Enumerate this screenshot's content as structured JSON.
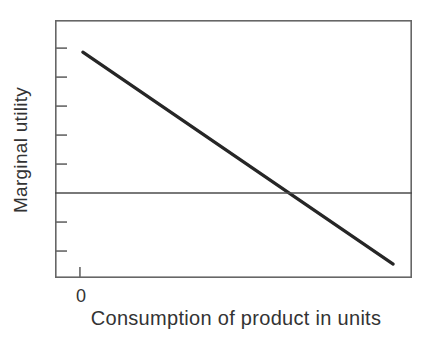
{
  "figure": {
    "background": "#ffffff"
  },
  "colors": {
    "frame": "#666666",
    "tick": "#666666",
    "curve": "#262626",
    "reference_line": "#4d4d4d",
    "text": "#333333"
  },
  "chart_data": {
    "type": "line",
    "title": "",
    "xlabel": "Consumption of product in units",
    "ylabel": "Marginal utility",
    "xlim": [
      -0.86,
      11.45
    ],
    "ylim": [
      -2.93,
      5.97
    ],
    "grid": false,
    "legend": false,
    "y_ticks": [
      5,
      4,
      3,
      2,
      1,
      -1,
      -2
    ],
    "x_ticks": [
      {
        "value": 0,
        "label": "0"
      }
    ],
    "series": [
      {
        "name": "marginal_utility_curve",
        "role": "curve",
        "points": [
          [
            0.1,
            4.86
          ],
          [
            10.8,
            -2.45
          ]
        ]
      },
      {
        "name": "zero_reference_line",
        "role": "reference",
        "points": [
          [
            -0.86,
            0
          ],
          [
            11.45,
            0
          ]
        ]
      }
    ]
  }
}
